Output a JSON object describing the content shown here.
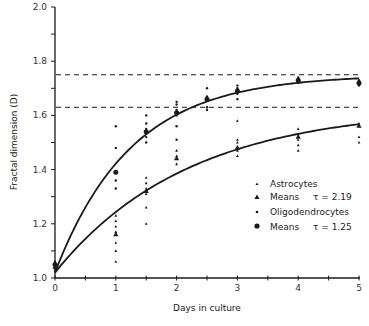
{
  "chart_data": {
    "type": "scatter",
    "title": "",
    "xlabel": "Days in culture",
    "ylabel": "Fractal dimension (D)",
    "xlim": [
      0,
      5
    ],
    "ylim": [
      1.0,
      2.0
    ],
    "x_ticks": [
      0,
      1,
      2,
      3,
      4,
      5
    ],
    "x_minor_step": 0.5,
    "y_ticks": [
      1.0,
      1.2,
      1.4,
      1.6,
      1.8,
      2.0
    ],
    "y_tick_labels": [
      "1.0",
      "1.2",
      "1.4",
      "1.6",
      "1.8",
      "2.0"
    ],
    "y_minor_step": 0.1,
    "grid": false,
    "legend_position": "lower right (inside plot)",
    "asymptotes": [
      {
        "name": "Oligodendrocyte plateau",
        "y": 1.75,
        "style": "dashed"
      },
      {
        "name": "Astrocyte plateau",
        "y": 1.63,
        "style": "dashed"
      }
    ],
    "series": [
      {
        "name": "Astrocytes",
        "marker": "small-triangle",
        "points": [
          [
            0,
            1.03
          ],
          [
            0,
            1.04
          ],
          [
            0,
            1.05
          ],
          [
            1,
            1.23
          ],
          [
            1,
            1.21
          ],
          [
            1,
            1.19
          ],
          [
            1,
            1.17
          ],
          [
            1,
            1.13
          ],
          [
            1,
            1.1
          ],
          [
            1,
            1.06
          ],
          [
            1.5,
            1.37
          ],
          [
            1.5,
            1.35
          ],
          [
            1.5,
            1.33
          ],
          [
            1.5,
            1.31
          ],
          [
            1.5,
            1.26
          ],
          [
            1.5,
            1.2
          ],
          [
            2,
            1.47
          ],
          [
            2,
            1.45
          ],
          [
            2,
            1.42
          ],
          [
            3,
            1.58
          ],
          [
            3,
            1.51
          ],
          [
            3,
            1.5
          ],
          [
            3,
            1.47
          ],
          [
            3,
            1.45
          ],
          [
            4,
            1.55
          ],
          [
            4,
            1.53
          ],
          [
            4,
            1.51
          ],
          [
            4,
            1.49
          ],
          [
            4,
            1.47
          ],
          [
            5,
            1.57
          ],
          [
            5,
            1.52
          ],
          [
            5,
            1.5
          ]
        ]
      },
      {
        "name": "Means (Astrocytes)",
        "marker": "triangle",
        "tau": 2.19,
        "label": "Means",
        "tau_label": "τ = 2.19",
        "points": [
          [
            0,
            1.04
          ],
          [
            1,
            1.16
          ],
          [
            1.5,
            1.32
          ],
          [
            2,
            1.44
          ],
          [
            3,
            1.48
          ],
          [
            4,
            1.52
          ],
          [
            5,
            1.56
          ]
        ]
      },
      {
        "name": "Oligodendrocytes",
        "marker": "small-dot",
        "points": [
          [
            0,
            1.04
          ],
          [
            0,
            1.06
          ],
          [
            1,
            1.56
          ],
          [
            1,
            1.48
          ],
          [
            1,
            1.36
          ],
          [
            1,
            1.33
          ],
          [
            1.5,
            1.6
          ],
          [
            1.5,
            1.57
          ],
          [
            1.5,
            1.55
          ],
          [
            1.5,
            1.52
          ],
          [
            1.5,
            1.5
          ],
          [
            2,
            1.65
          ],
          [
            2,
            1.64
          ],
          [
            2,
            1.62
          ],
          [
            2,
            1.6
          ],
          [
            2,
            1.56
          ],
          [
            2,
            1.51
          ],
          [
            2.5,
            1.7
          ],
          [
            2.5,
            1.67
          ],
          [
            2.5,
            1.63
          ],
          [
            2.5,
            1.62
          ],
          [
            3,
            1.71
          ],
          [
            3,
            1.7
          ],
          [
            3,
            1.68
          ],
          [
            3,
            1.66
          ],
          [
            4,
            1.74
          ],
          [
            4,
            1.72
          ],
          [
            5,
            1.73
          ],
          [
            5,
            1.71
          ]
        ]
      },
      {
        "name": "Means (Oligodendrocytes)",
        "marker": "dot",
        "tau": 1.25,
        "label": "Means",
        "tau_label": "τ = 1.25",
        "points": [
          [
            0,
            1.05
          ],
          [
            1,
            1.39
          ],
          [
            1.5,
            1.54
          ],
          [
            2,
            1.61
          ],
          [
            2.5,
            1.66
          ],
          [
            3,
            1.69
          ],
          [
            4,
            1.73
          ],
          [
            5,
            1.72
          ]
        ]
      }
    ],
    "fits": [
      {
        "name": "Oligodendrocyte fit",
        "model": "D0 + (Dinf - D0)(1 - exp(-t/tau))",
        "D0": 1.02,
        "Dinf": 1.75,
        "tau": 1.25
      },
      {
        "name": "Astrocyte fit",
        "model": "D0 + (Dinf - D0)(1 - exp(-t/tau))",
        "D0": 1.02,
        "Dinf": 1.63,
        "tau": 2.19
      }
    ]
  },
  "legend": {
    "items": [
      {
        "label": "Astrocytes",
        "tau_label": "",
        "marker": "small-triangle"
      },
      {
        "label": "Means",
        "tau_label": "τ = 2.19",
        "marker": "triangle"
      },
      {
        "label": "Oligodendrocytes",
        "tau_label": "",
        "marker": "small-dot"
      },
      {
        "label": "Means",
        "tau_label": "τ = 1.25",
        "marker": "dot"
      }
    ]
  },
  "axes": {
    "xlabel": "Days in culture",
    "ylabel": "Fractal dimension (D)"
  },
  "colors": {
    "ink": "#1a1a1a",
    "background": "#ffffff"
  }
}
